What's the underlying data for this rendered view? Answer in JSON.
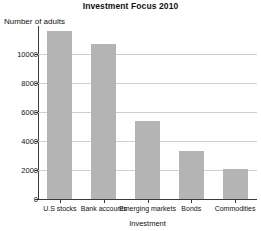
{
  "chart_data": {
    "type": "bar",
    "title": "Investment Focus 2010",
    "xlabel": "Investment",
    "ylabel": "Number of adults",
    "categories": [
      "U.S stocks",
      "Bank accounts",
      "Emerging markets",
      "Bonds",
      "Commodities"
    ],
    "values": [
      11600,
      10700,
      5400,
      3300,
      2050
    ],
    "ylim": [
      0,
      12000
    ],
    "yticks": [
      0,
      2000,
      4000,
      6000,
      8000,
      10000
    ],
    "ytick_labels": [
      "0",
      "2000",
      "4000",
      "6000",
      "8000",
      "10000"
    ],
    "grid": true,
    "legend": false,
    "bar_color": "#b4b4b4",
    "grid_color": "#cfcfcf",
    "axis_color": "#3a3a3a"
  }
}
